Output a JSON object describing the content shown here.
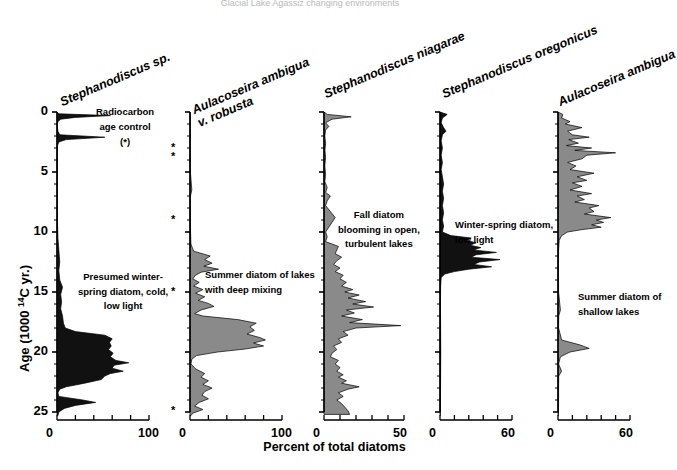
{
  "figure": {
    "top_caption": "Glacial Lake Agassiz changing environments",
    "y_axis": {
      "label_pre": "Age (1000 ",
      "label_sup": "14",
      "label_post": "C yr.)",
      "ticks": [
        0,
        5,
        10,
        15,
        20,
        25
      ],
      "range": [
        0,
        25.5
      ]
    },
    "x_axis_title": "Percent of total diatoms",
    "radiocarbon": {
      "line1": "Radiocarbon",
      "line2": "age control",
      "line3": "(*)",
      "marker": "*",
      "ages": [
        3.0,
        3.75,
        9.0,
        15.0,
        24.9
      ]
    },
    "panels": [
      {
        "title": "Stephanodiscus sp.",
        "title_lines": [
          "Stephanodiscus sp."
        ],
        "fill": "#111111",
        "xmax": 100,
        "x_tick_labels": [
          "0",
          "100"
        ],
        "annotation": [
          "Presumed winter-",
          "spring diatom, cold,",
          "low light"
        ],
        "series": [
          [
            0,
            0
          ],
          [
            0.15,
            2
          ],
          [
            0.3,
            58
          ],
          [
            0.45,
            20
          ],
          [
            0.6,
            4
          ],
          [
            0.8,
            1
          ],
          [
            1.0,
            0.5
          ],
          [
            1.3,
            0.5
          ],
          [
            1.6,
            1
          ],
          [
            1.9,
            3
          ],
          [
            2.1,
            52
          ],
          [
            2.3,
            10
          ],
          [
            2.5,
            2
          ],
          [
            2.8,
            0.5
          ],
          [
            3.5,
            0.3
          ],
          [
            5,
            0.3
          ],
          [
            7,
            0.4
          ],
          [
            9,
            0.5
          ],
          [
            10.5,
            1
          ],
          [
            11.5,
            2
          ],
          [
            12.5,
            3
          ],
          [
            13.2,
            2
          ],
          [
            14,
            3
          ],
          [
            14.6,
            6
          ],
          [
            15.2,
            4
          ],
          [
            15.8,
            5
          ],
          [
            16.4,
            4
          ],
          [
            17,
            6
          ],
          [
            17.6,
            7
          ],
          [
            18.0,
            9
          ],
          [
            18.3,
            20
          ],
          [
            18.6,
            52
          ],
          [
            18.9,
            60
          ],
          [
            19.2,
            57
          ],
          [
            19.5,
            59
          ],
          [
            19.8,
            56
          ],
          [
            20.1,
            61
          ],
          [
            20.4,
            58
          ],
          [
            20.7,
            64
          ],
          [
            20.9,
            78
          ],
          [
            21.1,
            62
          ],
          [
            21.35,
            60
          ],
          [
            21.6,
            72
          ],
          [
            21.8,
            58
          ],
          [
            22.0,
            52
          ],
          [
            22.3,
            48
          ],
          [
            22.6,
            30
          ],
          [
            22.9,
            10
          ],
          [
            23.1,
            3
          ],
          [
            23.4,
            1
          ],
          [
            23.7,
            2
          ],
          [
            24.0,
            28
          ],
          [
            24.2,
            42
          ],
          [
            24.45,
            20
          ],
          [
            24.7,
            8
          ],
          [
            25.0,
            2
          ],
          [
            25.3,
            1
          ]
        ]
      },
      {
        "title": "Aulacoseira ambigua v. robusta",
        "title_lines": [
          "Aulacoseira ambigua",
          "v. robusta"
        ],
        "fill": "#8a8a8a",
        "xmax": 100,
        "x_tick_labels": [
          "0",
          "100"
        ],
        "annotation": [
          "Summer diatom of lakes",
          "with deep mixing"
        ],
        "series": [
          [
            0,
            0
          ],
          [
            0.5,
            0.3
          ],
          [
            1.5,
            0.3
          ],
          [
            3,
            0.3
          ],
          [
            5,
            0.4
          ],
          [
            6.5,
            2
          ],
          [
            7,
            0.5
          ],
          [
            8,
            0.4
          ],
          [
            9,
            0.5
          ],
          [
            10,
            0.6
          ],
          [
            11,
            1
          ],
          [
            11.6,
            4
          ],
          [
            12.0,
            22
          ],
          [
            12.3,
            16
          ],
          [
            12.6,
            24
          ],
          [
            12.85,
            15
          ],
          [
            13.1,
            31
          ],
          [
            13.35,
            12
          ],
          [
            13.6,
            6
          ],
          [
            13.9,
            3
          ],
          [
            14.2,
            10
          ],
          [
            14.5,
            4
          ],
          [
            14.8,
            14
          ],
          [
            15.1,
            6
          ],
          [
            15.4,
            16
          ],
          [
            15.7,
            9
          ],
          [
            15.95,
            20
          ],
          [
            16.2,
            26
          ],
          [
            16.5,
            12
          ],
          [
            16.8,
            5
          ],
          [
            17.0,
            14
          ],
          [
            17.3,
            52
          ],
          [
            17.6,
            72
          ],
          [
            17.9,
            65
          ],
          [
            18.2,
            70
          ],
          [
            18.5,
            62
          ],
          [
            18.8,
            76
          ],
          [
            19.0,
            82
          ],
          [
            19.25,
            69
          ],
          [
            19.5,
            80
          ],
          [
            19.75,
            60
          ],
          [
            20.0,
            30
          ],
          [
            20.3,
            7
          ],
          [
            20.6,
            2
          ],
          [
            21.0,
            1
          ],
          [
            21.4,
            6
          ],
          [
            21.8,
            16
          ],
          [
            22.1,
            12
          ],
          [
            22.4,
            20
          ],
          [
            22.7,
            14
          ],
          [
            23.0,
            24
          ],
          [
            23.3,
            16
          ],
          [
            23.6,
            13
          ],
          [
            23.9,
            20
          ],
          [
            24.2,
            10
          ],
          [
            24.5,
            5
          ],
          [
            24.8,
            14
          ],
          [
            25.1,
            3
          ],
          [
            25.3,
            1
          ]
        ]
      },
      {
        "title": "Stephanodiscus niagarae",
        "title_lines": [
          "Stephanodiscus niagarae"
        ],
        "fill": "#8a8a8a",
        "xmax": 50,
        "x_tick_labels": [
          "0",
          "50"
        ],
        "annotation": [
          "Fall diatom",
          "blooming in  open,",
          "turbulent  lakes"
        ],
        "series": [
          [
            0,
            0
          ],
          [
            0.2,
            2
          ],
          [
            0.4,
            17
          ],
          [
            0.6,
            5
          ],
          [
            0.9,
            1
          ],
          [
            1.2,
            3
          ],
          [
            1.5,
            1
          ],
          [
            2.0,
            0.5
          ],
          [
            2.6,
            1
          ],
          [
            3.2,
            0.6
          ],
          [
            3.8,
            1
          ],
          [
            4.5,
            0.5
          ],
          [
            5.2,
            1
          ],
          [
            5.8,
            0.5
          ],
          [
            6.3,
            2
          ],
          [
            6.7,
            1
          ],
          [
            7.0,
            4
          ],
          [
            7.4,
            2
          ],
          [
            7.8,
            1
          ],
          [
            8.3,
            4
          ],
          [
            8.8,
            7
          ],
          [
            9.2,
            5
          ],
          [
            9.6,
            3
          ],
          [
            10.0,
            1
          ],
          [
            10.4,
            2
          ],
          [
            10.8,
            1
          ],
          [
            11.0,
            5
          ],
          [
            11.2,
            9
          ],
          [
            11.5,
            8
          ],
          [
            11.8,
            7
          ],
          [
            12.1,
            11
          ],
          [
            12.4,
            8
          ],
          [
            12.7,
            6
          ],
          [
            13.0,
            10
          ],
          [
            13.3,
            7
          ],
          [
            13.6,
            12
          ],
          [
            13.9,
            10
          ],
          [
            14.2,
            14
          ],
          [
            14.5,
            11
          ],
          [
            14.8,
            18
          ],
          [
            15.0,
            13
          ],
          [
            15.25,
            22
          ],
          [
            15.5,
            15
          ],
          [
            15.8,
            26
          ],
          [
            16.0,
            18
          ],
          [
            16.25,
            31
          ],
          [
            16.5,
            14
          ],
          [
            16.75,
            19
          ],
          [
            17.0,
            11
          ],
          [
            17.3,
            24
          ],
          [
            17.55,
            16
          ],
          [
            17.8,
            48
          ],
          [
            18.0,
            20
          ],
          [
            18.3,
            12
          ],
          [
            18.6,
            15
          ],
          [
            18.9,
            9
          ],
          [
            19.2,
            11
          ],
          [
            19.5,
            6
          ],
          [
            19.8,
            8
          ],
          [
            20.1,
            5
          ],
          [
            20.4,
            4
          ],
          [
            20.7,
            9
          ],
          [
            21.0,
            7
          ],
          [
            21.3,
            10
          ],
          [
            21.6,
            8
          ],
          [
            21.9,
            12
          ],
          [
            22.1,
            9
          ],
          [
            22.4,
            14
          ],
          [
            22.6,
            11
          ],
          [
            22.9,
            22
          ],
          [
            23.1,
            15
          ],
          [
            23.4,
            9
          ],
          [
            23.7,
            12
          ],
          [
            24.0,
            8
          ],
          [
            24.3,
            11
          ],
          [
            24.6,
            13
          ],
          [
            24.9,
            15
          ],
          [
            25.2,
            16
          ]
        ]
      },
      {
        "title": "Stephanodiscus oregonicus",
        "title_lines": [
          "Stephanodiscus oregonicus"
        ],
        "fill": "#111111",
        "xmax": 60,
        "x_tick_labels": [
          "0",
          "60"
        ],
        "annotation": [
          "Winter-spring diatom,",
          "low light"
        ],
        "series": [
          [
            0,
            0
          ],
          [
            0.2,
            6
          ],
          [
            0.5,
            2
          ],
          [
            0.9,
            1
          ],
          [
            1.3,
            3
          ],
          [
            1.6,
            5
          ],
          [
            1.9,
            2
          ],
          [
            2.4,
            1
          ],
          [
            3.0,
            2
          ],
          [
            3.6,
            1
          ],
          [
            4.2,
            2
          ],
          [
            4.8,
            1
          ],
          [
            5.4,
            2
          ],
          [
            6.0,
            3
          ],
          [
            6.6,
            2
          ],
          [
            7.2,
            3
          ],
          [
            7.8,
            2
          ],
          [
            8.4,
            3
          ],
          [
            9.0,
            2
          ],
          [
            9.5,
            3
          ],
          [
            10.0,
            2
          ],
          [
            10.3,
            9
          ],
          [
            10.5,
            26
          ],
          [
            10.7,
            22
          ],
          [
            10.9,
            30
          ],
          [
            11.1,
            25
          ],
          [
            11.3,
            34
          ],
          [
            11.5,
            28
          ],
          [
            11.7,
            47
          ],
          [
            11.9,
            30
          ],
          [
            12.1,
            26
          ],
          [
            12.3,
            50
          ],
          [
            12.5,
            33
          ],
          [
            12.7,
            28
          ],
          [
            12.9,
            43
          ],
          [
            13.1,
            24
          ],
          [
            13.3,
            12
          ],
          [
            13.5,
            4
          ],
          [
            13.8,
            1
          ],
          [
            14.5,
            0.5
          ],
          [
            16,
            0.4
          ],
          [
            18,
            0.5
          ],
          [
            20,
            0.6
          ],
          [
            22,
            0.5
          ],
          [
            24,
            0.4
          ],
          [
            25.3,
            0.3
          ]
        ]
      },
      {
        "title": "Aulacoseira ambigua",
        "title_lines": [
          "Aulacoseira ambigua"
        ],
        "fill": "#8a8a8a",
        "xmax": 60,
        "x_tick_labels": [
          "0",
          "60"
        ],
        "annotation": [
          "Summer diatom of",
          "shallow lakes"
        ],
        "series": [
          [
            0,
            0
          ],
          [
            0.2,
            4
          ],
          [
            0.5,
            3
          ],
          [
            0.8,
            10
          ],
          [
            1.0,
            6
          ],
          [
            1.3,
            20
          ],
          [
            1.6,
            8
          ],
          [
            1.9,
            12
          ],
          [
            2.1,
            26
          ],
          [
            2.3,
            9
          ],
          [
            2.6,
            17
          ],
          [
            2.8,
            7
          ],
          [
            3.0,
            28
          ],
          [
            3.2,
            14
          ],
          [
            3.4,
            48
          ],
          [
            3.6,
            24
          ],
          [
            3.9,
            20
          ],
          [
            4.2,
            8
          ],
          [
            4.5,
            15
          ],
          [
            4.8,
            10
          ],
          [
            5.1,
            30
          ],
          [
            5.4,
            16
          ],
          [
            5.7,
            24
          ],
          [
            5.9,
            12
          ],
          [
            6.2,
            20
          ],
          [
            6.5,
            10
          ],
          [
            6.8,
            28
          ],
          [
            7.0,
            16
          ],
          [
            7.3,
            22
          ],
          [
            7.5,
            14
          ],
          [
            7.8,
            34
          ],
          [
            8.0,
            26
          ],
          [
            8.3,
            30
          ],
          [
            8.5,
            22
          ],
          [
            8.8,
            44
          ],
          [
            9.0,
            32
          ],
          [
            9.2,
            38
          ],
          [
            9.4,
            28
          ],
          [
            9.6,
            36
          ],
          [
            9.8,
            20
          ],
          [
            10.0,
            8
          ],
          [
            10.3,
            3
          ],
          [
            10.7,
            1
          ],
          [
            11.5,
            0.5
          ],
          [
            13,
            0.4
          ],
          [
            15,
            0.5
          ],
          [
            16.5,
            2
          ],
          [
            17,
            0.6
          ],
          [
            18,
            0.5
          ],
          [
            19,
            3
          ],
          [
            19.4,
            18
          ],
          [
            19.7,
            26
          ],
          [
            20.0,
            10
          ],
          [
            20.4,
            2
          ],
          [
            21.0,
            0.5
          ],
          [
            21.6,
            3
          ],
          [
            22.0,
            0.6
          ],
          [
            23,
            0.5
          ],
          [
            24,
            0.5
          ],
          [
            25.3,
            0.4
          ]
        ]
      }
    ]
  }
}
